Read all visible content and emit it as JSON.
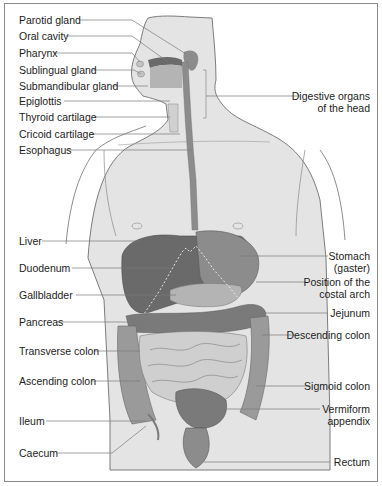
{
  "figure": {
    "colors": {
      "body_fill": "#e4e4e4",
      "outline": "#6e6e6e",
      "organ_dark": "#6a6a6a",
      "organ_mid": "#8c8c8c",
      "organ_light": "#b4b4b4",
      "intestine_light": "#cfcfcf",
      "leader_line": "#7a7a7a"
    }
  },
  "labels_left": [
    {
      "id": "parotid-gland",
      "text": "Parotid gland"
    },
    {
      "id": "oral-cavity",
      "text": "Oral cavity"
    },
    {
      "id": "pharynx",
      "text": "Pharynx"
    },
    {
      "id": "sublingual-gland",
      "text": "Sublingual gland"
    },
    {
      "id": "submandibular-gland",
      "text": "Submandibular gland"
    },
    {
      "id": "epiglottis",
      "text": "Epiglottis"
    },
    {
      "id": "thyroid-cartilage",
      "text": "Thyroid cartilage"
    },
    {
      "id": "cricoid-cartilage",
      "text": "Cricoid cartilage"
    },
    {
      "id": "esophagus",
      "text": "Esophagus"
    },
    {
      "id": "liver",
      "text": "Liver"
    },
    {
      "id": "duodenum",
      "text": "Duodenum"
    },
    {
      "id": "gallbladder",
      "text": "Gallbladder"
    },
    {
      "id": "pancreas",
      "text": "Pancreas"
    },
    {
      "id": "transverse-colon",
      "text": "Transverse colon"
    },
    {
      "id": "ascending-colon",
      "text": "Ascending colon"
    },
    {
      "id": "ileum",
      "text": "Ileum"
    },
    {
      "id": "caecum",
      "text": "Caecum"
    }
  ],
  "labels_right": [
    {
      "id": "digestive-organs-head",
      "line1": "Digestive organs",
      "line2": "of the head"
    },
    {
      "id": "stomach",
      "line1": "Stomach",
      "line2": "(gaster)"
    },
    {
      "id": "costal-arch",
      "line1": "Position of the",
      "line2": "costal arch"
    },
    {
      "id": "jejunum",
      "line1": "Jejunum",
      "line2": ""
    },
    {
      "id": "descending-colon",
      "line1": "Descending colon",
      "line2": ""
    },
    {
      "id": "sigmoid-colon",
      "line1": "Sigmoid colon",
      "line2": ""
    },
    {
      "id": "vermiform-appendix",
      "line1": "Vermiform",
      "line2": "appendix"
    },
    {
      "id": "rectum",
      "line1": "Rectum",
      "line2": ""
    }
  ]
}
